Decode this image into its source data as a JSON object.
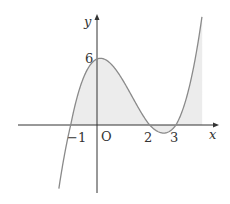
{
  "figure": {
    "function": "y = (x+1)(x-2)(x-3)",
    "axes": {
      "x_label": "x",
      "y_label": "y",
      "origin_label": "O"
    },
    "x_ticks": [
      {
        "value": -1,
        "label": "−1"
      },
      {
        "value": 2,
        "label": "2"
      },
      {
        "value": 3,
        "label": "3"
      }
    ],
    "y_ticks": [
      {
        "value": 6,
        "label": "6"
      }
    ],
    "shaded_region": {
      "from_x": -1,
      "to_x": 4,
      "description": "area between curve and x-axis"
    },
    "colors": {
      "curve": "#8a8a8a",
      "shade": "#ececec",
      "axis": "#333333"
    }
  }
}
